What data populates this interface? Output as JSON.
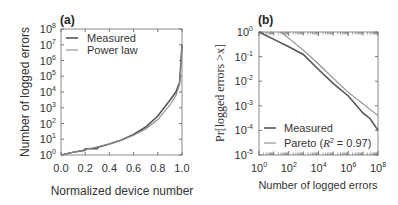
{
  "chart_data": [
    {
      "panel": "(a)",
      "type": "line",
      "title": "",
      "xlabel": "Normalized device number",
      "ylabel": "Number of logged errors",
      "yscale": "log",
      "xlim": [
        0.0,
        1.0
      ],
      "ylim": [
        1,
        100000000
      ],
      "x_ticks": [
        "0.0",
        "0.2",
        "0.4",
        "0.6",
        "0.8",
        "1.0"
      ],
      "y_ticks": [
        "10^0",
        "10^1",
        "10^2",
        "10^3",
        "10^4",
        "10^5",
        "10^6",
        "10^7",
        "10^8"
      ],
      "legend": [
        "Measured",
        "Power law"
      ],
      "legend_position": "upper left",
      "grid": false,
      "series": [
        {
          "name": "Measured",
          "x": [
            0.0,
            0.1,
            0.2,
            0.2,
            0.3,
            0.3,
            0.4,
            0.5,
            0.6,
            0.7,
            0.8,
            0.9,
            0.95,
            0.98,
            1.0
          ],
          "y": [
            1,
            1.5,
            2,
            2.5,
            2.5,
            3,
            5,
            9,
            20,
            60,
            300,
            3000,
            10000,
            40000,
            10000000
          ]
        },
        {
          "name": "Power law",
          "x": [
            0.0,
            0.1,
            0.2,
            0.3,
            0.4,
            0.5,
            0.6,
            0.7,
            0.8,
            0.9,
            0.95,
            0.98,
            1.0
          ],
          "y": [
            1,
            1.5,
            2.2,
            3.3,
            5,
            9,
            18,
            45,
            180,
            1500,
            6000,
            30000,
            10000000
          ]
        }
      ]
    },
    {
      "panel": "(b)",
      "type": "line",
      "title": "",
      "xlabel": "Number of logged errors",
      "ylabel": "Pr[logged errors > x]",
      "xscale": "log",
      "yscale": "log",
      "xlim": [
        1,
        100000000
      ],
      "ylim": [
        1e-05,
        1
      ],
      "x_ticks": [
        "10^0",
        "10^2",
        "10^4",
        "10^6",
        "10^8"
      ],
      "y_ticks": [
        "10^0",
        "10^-1",
        "10^-2",
        "10^-3",
        "10^-4",
        "10^-5"
      ],
      "legend": [
        "Measured",
        "Pareto (R^2 = 0.97)"
      ],
      "legend_position": "lower left",
      "annotations": [
        "R^2 = 0.97"
      ],
      "grid": false,
      "series": [
        {
          "name": "Measured",
          "x": [
            1,
            10,
            100,
            1000,
            10000,
            100000,
            1000000,
            10000000,
            30000000,
            100000000
          ],
          "y": [
            1,
            0.5,
            0.25,
            0.12,
            0.03,
            0.008,
            0.0025,
            0.0005,
            0.0003,
            0.0001
          ]
        },
        {
          "name": "Pareto (R^2 = 0.97)",
          "x": [
            30,
            100,
            1000,
            10000,
            100000,
            1000000,
            10000000,
            100000000
          ],
          "y": [
            1,
            0.55,
            0.18,
            0.05,
            0.013,
            0.0035,
            0.0012,
            0.0004
          ]
        }
      ]
    }
  ],
  "panels": {
    "a": {
      "label": "(a)",
      "xlabel": "Normalized device number",
      "ylabel": "Number of logged errors",
      "legend": [
        "Measured",
        "Power law"
      ],
      "x_ticks": [
        "0.0",
        "0.2",
        "0.4",
        "0.6",
        "0.8",
        "1.0"
      ],
      "y_exponents": [
        "0",
        "1",
        "2",
        "3",
        "4",
        "5",
        "6",
        "7",
        "8"
      ]
    },
    "b": {
      "label": "(b)",
      "xlabel": "Number of logged errors",
      "ylabel": "Pr[logged errors >x]",
      "legend_measured": "Measured",
      "legend_pareto_prefix": "Pareto (",
      "legend_pareto_r": "R",
      "legend_pareto_sup": "2",
      "legend_pareto_suffix": " = 0.97)",
      "x_exponents": [
        "0",
        "2",
        "4",
        "6",
        "8"
      ],
      "y_exponents": [
        "0",
        "-1",
        "-2",
        "-3",
        "-4",
        "-5"
      ]
    }
  },
  "colors": {
    "measured": "#555555",
    "fit": "#8a8a8a",
    "axis": "#777777"
  }
}
